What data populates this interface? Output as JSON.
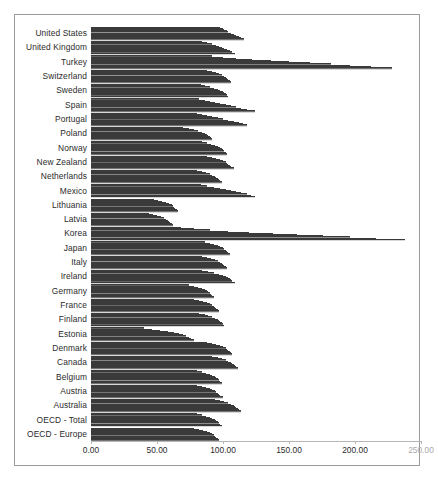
{
  "chart_data": {
    "type": "bar",
    "orientation": "horizontal",
    "title": "",
    "subtitle": "",
    "xlabel": "",
    "ylabel": "",
    "xlim": [
      0,
      250
    ],
    "xticks": [
      "0.00",
      "50.00",
      "100.00",
      "150.00",
      "200.00",
      "250.00"
    ],
    "xtick_values": [
      0,
      50,
      100,
      150,
      200,
      250
    ],
    "grid": false,
    "legend": "none",
    "bar_color": "#777777",
    "frame_color": "#9a9a9a",
    "axis_color": "#b6b6b6",
    "label_color": "#2b2b2b",
    "faded_label_color": "#a9a9a9",
    "categories": [
      "United States",
      "United Kingdom",
      "Turkey",
      "Switzerland",
      "Sweden",
      "Spain",
      "Portugal",
      "Poland",
      "Norway",
      "New Zealand",
      "Netherlands",
      "Mexico",
      "Lithuania",
      "Latvia",
      "Korea",
      "Japan",
      "Italy",
      "Ireland",
      "Germany",
      "France",
      "Finland",
      "Estonia",
      "Denmark",
      "Canada",
      "Belgium",
      "Austria",
      "Australia",
      "OECD - Total",
      "OECD - Europe"
    ],
    "series_count": 11,
    "values": [
      [
        98,
        100,
        101,
        103,
        104,
        106,
        108,
        110,
        112,
        114,
        116
      ],
      [
        84,
        88,
        92,
        95,
        97,
        99,
        101,
        103,
        105,
        107,
        109
      ],
      [
        92,
        100,
        110,
        122,
        136,
        150,
        166,
        182,
        196,
        212,
        228
      ],
      [
        88,
        92,
        95,
        97,
        99,
        101,
        102,
        103,
        104,
        105,
        106
      ],
      [
        83,
        86,
        90,
        93,
        96,
        98,
        100,
        101,
        102,
        103,
        104
      ],
      [
        82,
        86,
        90,
        94,
        98,
        102,
        106,
        110,
        114,
        118,
        124
      ],
      [
        80,
        84,
        88,
        92,
        96,
        100,
        104,
        108,
        112,
        115,
        118
      ],
      [
        70,
        74,
        78,
        81,
        84,
        86,
        88,
        89,
        90,
        91,
        92
      ],
      [
        84,
        88,
        91,
        94,
        96,
        98,
        99,
        100,
        101,
        102,
        103
      ],
      [
        88,
        92,
        95,
        98,
        100,
        102,
        103,
        104,
        105,
        106,
        108
      ],
      [
        80,
        84,
        87,
        90,
        92,
        94,
        95,
        96,
        97,
        98,
        99
      ],
      [
        83,
        88,
        93,
        98,
        102,
        106,
        110,
        114,
        118,
        121,
        124
      ],
      [
        48,
        51,
        54,
        57,
        59,
        61,
        62,
        63,
        64,
        65,
        66
      ],
      [
        44,
        47,
        50,
        53,
        55,
        57,
        58,
        59,
        60,
        61,
        62
      ],
      [
        68,
        78,
        90,
        104,
        120,
        138,
        156,
        176,
        196,
        216,
        238
      ],
      [
        86,
        90,
        93,
        96,
        98,
        100,
        101,
        102,
        103,
        104,
        105
      ],
      [
        84,
        88,
        91,
        94,
        96,
        98,
        99,
        100,
        101,
        102,
        103
      ],
      [
        84,
        89,
        93,
        97,
        100,
        102,
        104,
        105,
        106,
        107,
        109
      ],
      [
        74,
        78,
        81,
        84,
        86,
        88,
        89,
        90,
        91,
        92,
        93
      ],
      [
        78,
        82,
        85,
        88,
        90,
        92,
        93,
        94,
        95,
        96,
        97
      ],
      [
        82,
        86,
        89,
        92,
        94,
        96,
        97,
        98,
        99,
        100,
        101
      ],
      [
        40,
        46,
        52,
        58,
        63,
        67,
        70,
        72,
        74,
        76,
        78
      ],
      [
        88,
        92,
        95,
        98,
        100,
        102,
        103,
        104,
        105,
        106,
        107
      ],
      [
        92,
        96,
        99,
        102,
        104,
        106,
        107,
        108,
        109,
        110,
        111
      ],
      [
        80,
        84,
        87,
        90,
        92,
        94,
        95,
        96,
        97,
        98,
        99
      ],
      [
        80,
        84,
        87,
        90,
        92,
        94,
        95,
        96,
        97,
        98,
        100
      ],
      [
        94,
        98,
        101,
        104,
        106,
        108,
        109,
        110,
        111,
        112,
        114
      ],
      [
        80,
        84,
        87,
        90,
        92,
        94,
        95,
        96,
        97,
        98,
        99
      ],
      [
        78,
        82,
        85,
        88,
        90,
        92,
        93,
        94,
        95,
        96,
        97
      ]
    ]
  }
}
